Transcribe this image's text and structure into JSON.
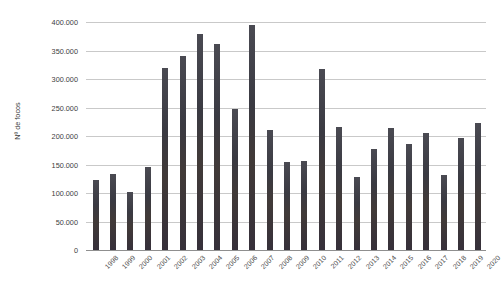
{
  "chart_data": {
    "type": "bar",
    "title": "",
    "xlabel": "",
    "ylabel": "Nº de focos",
    "categories": [
      "1998",
      "1999",
      "2000",
      "2001",
      "2002",
      "2003",
      "2004",
      "2005",
      "2006",
      "2007",
      "2008",
      "2009",
      "2010",
      "2011",
      "2012",
      "2013",
      "2014",
      "2015",
      "2016",
      "2017",
      "2018",
      "2019",
      "2020"
    ],
    "values": [
      123000,
      133000,
      101000,
      145000,
      320000,
      341000,
      379000,
      361000,
      248000,
      394000,
      210000,
      154000,
      157000,
      318000,
      216000,
      128000,
      177000,
      214000,
      186000,
      205000,
      132000,
      196000,
      222000
    ],
    "series": [
      {
        "name": "Nº de focos",
        "values": [
          123000,
          133000,
          101000,
          145000,
          320000,
          341000,
          379000,
          361000,
          248000,
          394000,
          210000,
          154000,
          157000,
          318000,
          216000,
          128000,
          177000,
          214000,
          186000,
          205000,
          132000,
          196000,
          222000
        ]
      }
    ],
    "ylim": [
      0,
      400000
    ],
    "y_ticks": [
      0,
      50000,
      100000,
      150000,
      200000,
      250000,
      300000,
      350000,
      400000
    ],
    "y_tick_labels": [
      "0",
      "50.000",
      "100.000",
      "150.000",
      "200.000",
      "250.000",
      "300.000",
      "350.000",
      "400.000"
    ],
    "grid": true,
    "legend": "none",
    "bar_color": "#3e3a40",
    "gridline_color": "#c9c9c9",
    "background_color": "#ffffff",
    "xtick_rotation": -45
  }
}
